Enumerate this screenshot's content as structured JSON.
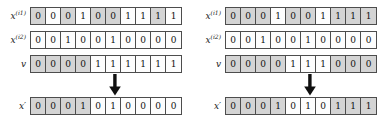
{
  "figure": {
    "panels": [
      {
        "name": "left-crossover-example",
        "rows": [
          {
            "id": "parent-1",
            "label_base": "x",
            "label_sup": "(i1)",
            "values": [
              "0",
              "0",
              "0",
              "1",
              "0",
              "0",
              "1",
              "1",
              "1",
              "1"
            ],
            "shading": [
              "shaded",
              "plain",
              "shaded",
              "plain",
              "shaded",
              "shaded",
              "plain",
              "plain",
              "shaded",
              "plain"
            ]
          },
          {
            "id": "parent-2",
            "label_base": "x",
            "label_sup": "(i2)",
            "values": [
              "0",
              "0",
              "1",
              "0",
              "0",
              "1",
              "0",
              "0",
              "0",
              "0"
            ],
            "shading": [
              "plain",
              "plain",
              "plain",
              "plain",
              "plain",
              "plain",
              "plain",
              "plain",
              "plain",
              "plain"
            ]
          },
          {
            "id": "mask",
            "label_base": "v",
            "label_sup": "",
            "values": [
              "0",
              "0",
              "0",
              "0",
              "1",
              "1",
              "1",
              "1",
              "1",
              "1"
            ],
            "shading": [
              "shaded",
              "shaded",
              "shaded",
              "shaded",
              "plain",
              "plain",
              "plain",
              "plain",
              "plain",
              "plain"
            ]
          },
          {
            "id": "offspring",
            "label_base": "x",
            "label_sup": "",
            "label_prime": "′",
            "values": [
              "0",
              "0",
              "0",
              "1",
              "0",
              "1",
              "0",
              "0",
              "0",
              "0"
            ],
            "shading": [
              "shaded",
              "shaded",
              "shaded",
              "shaded",
              "plain",
              "plain",
              "plain",
              "plain",
              "plain",
              "plain"
            ]
          }
        ],
        "arrow": "down-arrow"
      },
      {
        "name": "right-crossover-example",
        "rows": [
          {
            "id": "parent-1",
            "label_base": "x",
            "label_sup": "(i1)",
            "values": [
              "0",
              "0",
              "0",
              "1",
              "0",
              "0",
              "1",
              "1",
              "1",
              "1"
            ],
            "shading": [
              "shaded",
              "shaded",
              "shaded",
              "plain",
              "shaded",
              "shaded",
              "plain",
              "shaded",
              "shaded",
              "shaded"
            ]
          },
          {
            "id": "parent-2",
            "label_base": "x",
            "label_sup": "(i2)",
            "values": [
              "0",
              "0",
              "1",
              "0",
              "0",
              "1",
              "0",
              "0",
              "0",
              "0"
            ],
            "shading": [
              "plain",
              "plain",
              "plain",
              "plain",
              "plain",
              "plain",
              "plain",
              "plain",
              "plain",
              "plain"
            ]
          },
          {
            "id": "mask",
            "label_base": "v",
            "label_sup": "",
            "values": [
              "0",
              "0",
              "0",
              "0",
              "1",
              "1",
              "1",
              "0",
              "0",
              "0"
            ],
            "shading": [
              "shaded",
              "shaded",
              "shaded",
              "shaded",
              "plain",
              "plain",
              "plain",
              "shaded",
              "shaded",
              "shaded"
            ]
          },
          {
            "id": "offspring",
            "label_base": "x",
            "label_sup": "",
            "label_prime": "′",
            "values": [
              "0",
              "0",
              "0",
              "1",
              "0",
              "1",
              "0",
              "1",
              "1",
              "1"
            ],
            "shading": [
              "shaded",
              "shaded",
              "shaded",
              "shaded",
              "plain",
              "plain",
              "plain",
              "shaded",
              "shaded",
              "shaded"
            ]
          }
        ],
        "arrow": "down-arrow"
      }
    ],
    "colors": {
      "cell_border": "#4d4d4d",
      "cell_shaded": "#d4d4d4",
      "cell_plain": "#fdfdfd",
      "text": "#101010",
      "background": "#ffffff"
    },
    "layout": {
      "row_tops": [
        6,
        30,
        54,
        96
      ],
      "arrow_top": 74,
      "cells_per_row": 10
    }
  }
}
